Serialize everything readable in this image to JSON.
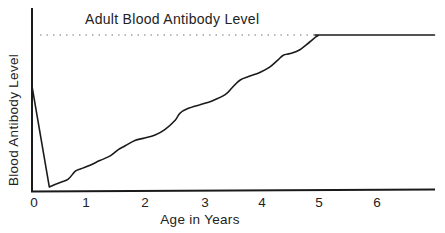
{
  "chart_data": {
    "type": "line",
    "title": "",
    "xlabel": "Age in Years",
    "ylabel": "Blood Antibody Level",
    "xlim": [
      0,
      7
    ],
    "ylim": [
      0,
      100
    ],
    "x_ticks": [
      "0",
      "1",
      "2",
      "3",
      "4",
      "5",
      "6"
    ],
    "y_ticks": [],
    "grid": false,
    "legend": null,
    "annotations": [
      {
        "text": "Adult Blood Antibody Level",
        "type": "dotted-reference-line",
        "y": 100,
        "x_range": [
          0.15,
          5.0
        ]
      }
    ],
    "series": [
      {
        "name": "Blood Antibody Level",
        "points": [
          [
            0.0,
            67
          ],
          [
            0.3,
            2
          ],
          [
            0.5,
            5
          ],
          [
            0.63,
            7
          ],
          [
            0.75,
            12
          ],
          [
            0.84,
            13.5
          ],
          [
            1.01,
            16
          ],
          [
            1.18,
            19
          ],
          [
            1.36,
            22
          ],
          [
            1.5,
            26
          ],
          [
            1.62,
            28.5
          ],
          [
            1.79,
            32
          ],
          [
            1.96,
            33.5
          ],
          [
            2.14,
            35.5
          ],
          [
            2.31,
            39
          ],
          [
            2.49,
            45
          ],
          [
            2.57,
            49.5
          ],
          [
            2.71,
            52.5
          ],
          [
            2.92,
            55
          ],
          [
            3.13,
            57.5
          ],
          [
            3.36,
            61.5
          ],
          [
            3.48,
            66
          ],
          [
            3.62,
            71
          ],
          [
            3.79,
            73.5
          ],
          [
            3.97,
            76
          ],
          [
            4.14,
            79.5
          ],
          [
            4.28,
            84
          ],
          [
            4.37,
            87
          ],
          [
            4.49,
            88
          ],
          [
            4.66,
            90.5
          ],
          [
            4.83,
            95.5
          ],
          [
            4.97,
            99.5
          ],
          [
            5.1,
            100
          ],
          [
            7.0,
            100
          ]
        ]
      }
    ]
  },
  "labels": {
    "xlabel": "Age in Years",
    "ylabel": "Blood Antibody Level",
    "annotation": "Adult Blood Antibody Level",
    "ticks": [
      "0",
      "1",
      "2",
      "3",
      "4",
      "5",
      "6"
    ]
  }
}
